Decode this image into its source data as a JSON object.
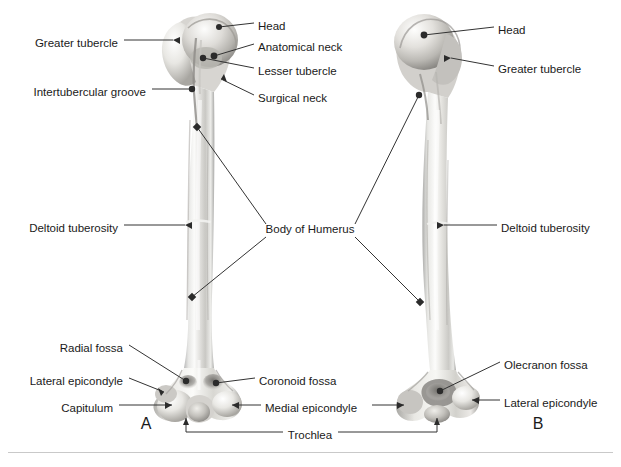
{
  "figure": {
    "background_color": "#ffffff",
    "text_color": "#1a1a1a",
    "leader_color": "#333333",
    "rule_color": "#c9c9c9",
    "panel_letters": [
      {
        "name": "panel-a-letter",
        "text": "A",
        "x": 146,
        "y": 425
      },
      {
        "name": "panel-b-letter",
        "text": "B",
        "x": 538,
        "y": 425
      }
    ]
  },
  "labels": [
    {
      "name": "label-head-a",
      "text": "Head",
      "x": 258,
      "y": 27,
      "align": "left"
    },
    {
      "name": "label-anatomical-neck",
      "text": "Anatomical neck",
      "x": 258,
      "y": 48,
      "align": "left"
    },
    {
      "name": "label-lesser-tubercle",
      "text": "Lesser tubercle",
      "x": 258,
      "y": 72,
      "align": "left"
    },
    {
      "name": "label-surgical-neck",
      "text": "Surgical neck",
      "x": 258,
      "y": 99,
      "align": "left"
    },
    {
      "name": "label-greater-tubercle-a",
      "text": "Greater tubercle",
      "x": 118,
      "y": 44,
      "align": "right"
    },
    {
      "name": "label-intertubercular-groove",
      "text": "Intertubercular groove",
      "x": 146,
      "y": 93,
      "align": "right"
    },
    {
      "name": "label-deltoid-tuberosity-a",
      "text": "Deltoid tuberosity",
      "x": 118,
      "y": 229,
      "align": "right"
    },
    {
      "name": "label-body-of-humerus",
      "text": "Body of Humerus",
      "x": 310,
      "y": 231,
      "align": "center"
    },
    {
      "name": "label-head-b",
      "text": "Head",
      "x": 498,
      "y": 31,
      "align": "left"
    },
    {
      "name": "label-greater-tubercle-b",
      "text": "Greater tubercle",
      "x": 498,
      "y": 70,
      "align": "left"
    },
    {
      "name": "label-deltoid-tuberosity-b",
      "text": "Deltoid tuberosity",
      "x": 501,
      "y": 229,
      "align": "left"
    },
    {
      "name": "label-radial-fossa",
      "text": "Radial fossa",
      "x": 123,
      "y": 349,
      "align": "right"
    },
    {
      "name": "label-lateral-epicondyle-a",
      "text": "Lateral epicondyle",
      "x": 123,
      "y": 382,
      "align": "right"
    },
    {
      "name": "label-capitulum",
      "text": "Capitulum",
      "x": 113,
      "y": 409,
      "align": "right"
    },
    {
      "name": "label-coronoid-fossa",
      "text": "Coronoid fossa",
      "x": 259,
      "y": 382,
      "align": "left"
    },
    {
      "name": "label-medial-epicondyle",
      "text": "Medial epicondyle",
      "x": 265,
      "y": 409,
      "align": "left"
    },
    {
      "name": "label-trochlea",
      "text": "Trochlea",
      "x": 310,
      "y": 436,
      "align": "center"
    },
    {
      "name": "label-olecranon-fossa",
      "text": "Olecranon fossa",
      "x": 504,
      "y": 366,
      "align": "left"
    },
    {
      "name": "label-lateral-epicondyle-b",
      "text": "Lateral epicondyle",
      "x": 504,
      "y": 404,
      "align": "left"
    }
  ],
  "bottom_rule": {
    "name": "footer-divider",
    "y": 452
  }
}
